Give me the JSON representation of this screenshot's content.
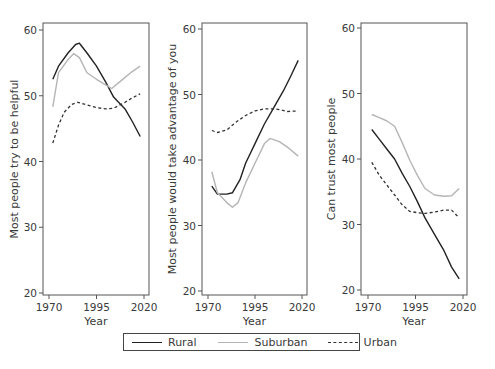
{
  "chart_data": [
    {
      "type": "line",
      "title": "",
      "xlabel": "Year",
      "ylabel": "Most people try to be helpful",
      "xlim": [
        1970,
        2020
      ],
      "ylim": [
        20,
        60
      ],
      "xticks": [
        1970,
        1995,
        2020
      ],
      "yticks": [
        20,
        30,
        40,
        50,
        60
      ],
      "series": [
        {
          "name": "Rural",
          "x": [
            1972,
            1975,
            1980,
            1984,
            1986,
            1990,
            1995,
            2000,
            2004,
            2010,
            2014,
            2018
          ],
          "values": [
            52.5,
            54.5,
            56.5,
            57.8,
            58.0,
            56.5,
            54.5,
            52.0,
            49.8,
            48.0,
            46.0,
            43.8
          ]
        },
        {
          "name": "Suburban",
          "x": [
            1972,
            1975,
            1980,
            1983,
            1986,
            1990,
            1995,
            2000,
            2003,
            2008,
            2013,
            2018
          ],
          "values": [
            48.3,
            53.5,
            55.5,
            56.4,
            55.8,
            53.5,
            52.5,
            51.6,
            51.1,
            52.3,
            53.5,
            54.5
          ]
        },
        {
          "name": "Urban",
          "x": [
            1972,
            1975,
            1978,
            1982,
            1985,
            1990,
            1995,
            2000,
            2004,
            2010,
            2014,
            2018
          ],
          "values": [
            42.8,
            45.5,
            47.5,
            48.7,
            49.0,
            48.6,
            48.2,
            48.0,
            48.1,
            49.0,
            49.7,
            50.3
          ]
        }
      ],
      "legend_position": "bottom"
    },
    {
      "type": "line",
      "title": "",
      "xlabel": "Year",
      "ylabel": "Most people would take advantage of you",
      "xlim": [
        1970,
        2020
      ],
      "ylim": [
        20,
        60
      ],
      "xticks": [
        1970,
        1995,
        2020
      ],
      "yticks": [
        20,
        30,
        40,
        50,
        60
      ],
      "series": [
        {
          "name": "Rural",
          "x": [
            1972,
            1975,
            1980,
            1983,
            1987,
            1990,
            1995,
            2000,
            2005,
            2010,
            2014,
            2018
          ],
          "values": [
            36.0,
            34.8,
            34.8,
            35.0,
            37.0,
            39.5,
            42.5,
            45.5,
            48.0,
            50.5,
            52.8,
            55.2
          ]
        },
        {
          "name": "Suburban",
          "x": [
            1972,
            1975,
            1980,
            1983,
            1986,
            1990,
            1995,
            2000,
            2003,
            2008,
            2013,
            2018
          ],
          "values": [
            38.2,
            35.0,
            33.5,
            32.8,
            33.5,
            36.5,
            39.5,
            42.5,
            43.3,
            42.8,
            41.8,
            40.6
          ]
        },
        {
          "name": "Urban",
          "x": [
            1972,
            1975,
            1980,
            1985,
            1990,
            1995,
            2000,
            2005,
            2008,
            2012,
            2018
          ],
          "values": [
            44.5,
            44.2,
            44.6,
            45.8,
            46.8,
            47.5,
            47.8,
            47.8,
            47.7,
            47.4,
            47.5
          ]
        }
      ],
      "legend_position": "bottom"
    },
    {
      "type": "line",
      "title": "",
      "xlabel": "Year",
      "ylabel": "Can trust most people",
      "xlim": [
        1970,
        2020
      ],
      "ylim": [
        20,
        60
      ],
      "xticks": [
        1970,
        1995,
        2020
      ],
      "yticks": [
        20,
        30,
        40,
        50,
        60
      ],
      "series": [
        {
          "name": "Rural",
          "x": [
            1972,
            1976,
            1980,
            1984,
            1988,
            1992,
            1996,
            2000,
            2005,
            2010,
            2014,
            2018
          ],
          "values": [
            44.5,
            43.0,
            41.5,
            40.0,
            37.8,
            35.8,
            33.5,
            31.0,
            28.5,
            26.0,
            23.5,
            21.7
          ]
        },
        {
          "name": "Suburban",
          "x": [
            1972,
            1976,
            1980,
            1984,
            1988,
            1992,
            1996,
            2000,
            2005,
            2010,
            2014,
            2018
          ],
          "values": [
            46.8,
            46.3,
            45.8,
            45.0,
            42.5,
            39.8,
            37.5,
            35.5,
            34.5,
            34.3,
            34.4,
            35.5
          ]
        },
        {
          "name": "Urban",
          "x": [
            1972,
            1976,
            1980,
            1984,
            1988,
            1992,
            1996,
            2000,
            2005,
            2010,
            2014,
            2018
          ],
          "values": [
            39.5,
            37.5,
            36.0,
            34.5,
            33.0,
            32.0,
            31.8,
            31.7,
            31.9,
            32.2,
            32.2,
            31.0
          ]
        }
      ],
      "legend_position": "bottom"
    }
  ],
  "legend": {
    "items": [
      {
        "label": "Rural",
        "style": "solid-dark"
      },
      {
        "label": "Suburban",
        "style": "solid-light"
      },
      {
        "label": "Urban",
        "style": "dashed-dark"
      }
    ]
  },
  "colors": {
    "rural": "#222222",
    "suburban": "#b5b5b5",
    "urban": "#333333",
    "axis": "#555555",
    "text": "#3a3a3a"
  },
  "panels": [
    {
      "ylabel": "Most people try to be helpful",
      "xlabel": "Year",
      "xticks": [
        "1970",
        "1995",
        "2020"
      ],
      "yticks": [
        "20",
        "30",
        "40",
        "50",
        "60"
      ]
    },
    {
      "ylabel": "Most people would take advantage of you",
      "xlabel": "Year",
      "xticks": [
        "1970",
        "1995",
        "2020"
      ],
      "yticks": [
        "20",
        "30",
        "40",
        "50",
        "60"
      ]
    },
    {
      "ylabel": "Can trust most people",
      "xlabel": "Year",
      "xticks": [
        "1970",
        "1995",
        "2020"
      ],
      "yticks": [
        "20",
        "30",
        "40",
        "50",
        "60"
      ]
    }
  ]
}
